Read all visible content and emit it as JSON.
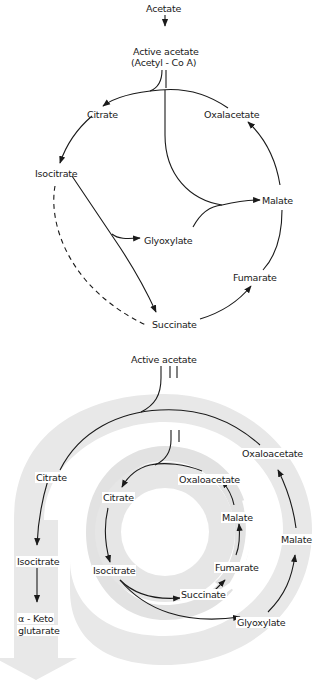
{
  "top_diagram": {
    "title": "Glyoxylate cycle",
    "labels": {
      "acetate": "Acetate",
      "active_acetate_line1": "Active  acetate",
      "active_acetate_line2": "(Acetyl - Co A)",
      "citrate": "Citrate",
      "oxalacetate": "Oxalacetate",
      "isocitrate": "Isocitrate",
      "malate": "Malate",
      "glyoxylate": "Glyoxylate",
      "fumarate": "Fumarate",
      "succinate": "Succinate"
    }
  },
  "bottom_diagram": {
    "title": "Spiral representation",
    "labels": {
      "active_acetate": "Active  acetate",
      "outer_citrate": "Citrate",
      "outer_isocitrate": "Isocitrate",
      "outer_keto_line1": "α - Keto",
      "outer_keto_line2": "glutarate",
      "outer_oxaloacetate": "Oxaloacetate",
      "outer_malate": "Malate",
      "glyoxylate": "Glyoxylate",
      "inner_citrate": "Citrate",
      "inner_isocitrate": "Isocitrate",
      "inner_oxaloacetate": "Oxaloacetate",
      "inner_malate": "Malate",
      "inner_fumarate": "Fumarate",
      "inner_succinate": "Succinate"
    }
  },
  "colors": {
    "line": "#1a1a1a",
    "band": "#e6e6e6",
    "background": "#ffffff"
  }
}
